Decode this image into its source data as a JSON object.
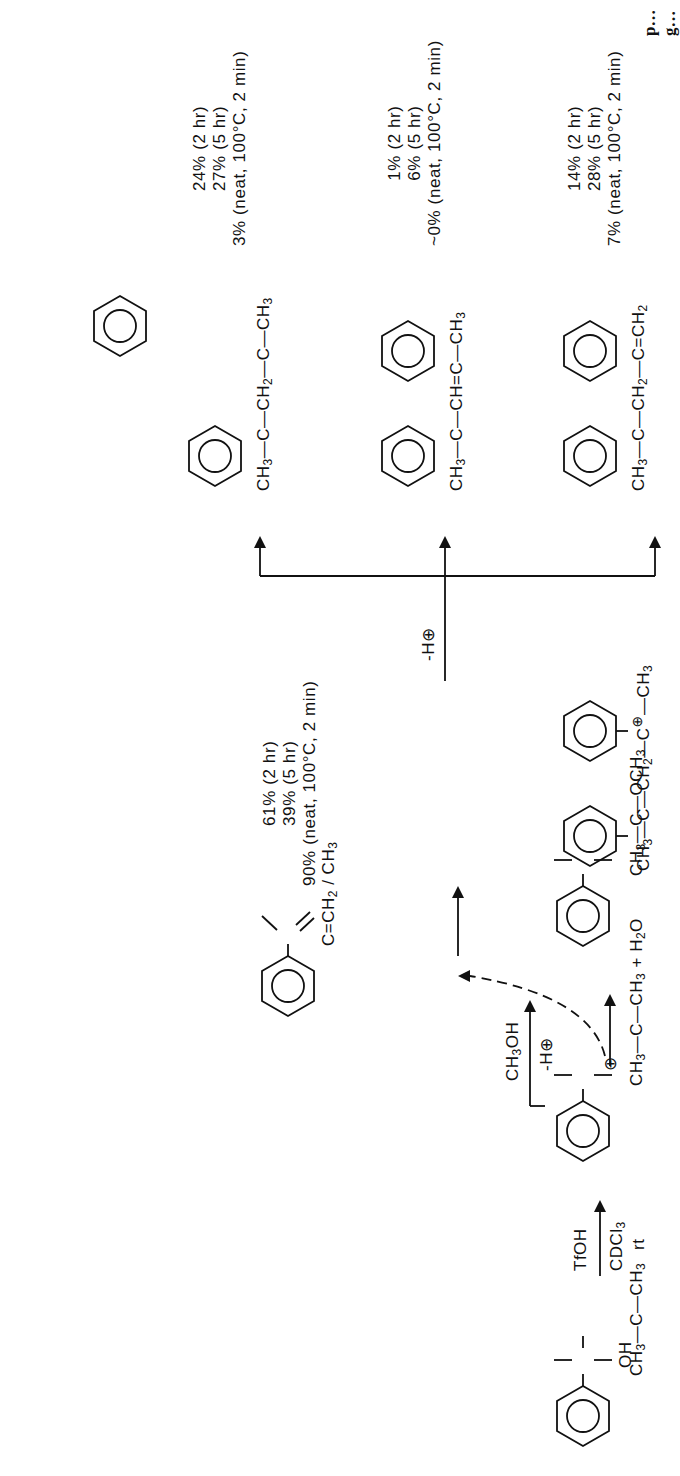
{
  "header": {
    "text": "p…g…"
  },
  "scheme": {
    "starting_material": {
      "name": "2-phenyl-2-propanol",
      "labels": [
        "CH3",
        "C",
        "CH3",
        "OH"
      ]
    },
    "reagents": {
      "above": "TfOH",
      "below": "CDCl3",
      "below2": "rt"
    },
    "cation": {
      "name": "cumyl cation",
      "byproduct": "+ H2O",
      "charge": "⊕"
    },
    "methanol_trap": {
      "reagent": "CH3OH",
      "loss": "-H⊕",
      "product": "cumyl methyl ether",
      "labels": [
        "CH3",
        "C",
        "CH3",
        "OCH3"
      ]
    },
    "alpha_methylstyrene": {
      "labels": [
        "C",
        "CH3",
        "CH2"
      ],
      "yields": [
        "61% (2 hr)",
        "39% (5 hr)",
        "90% (neat, 100°C, 2 min)"
      ]
    },
    "dimer_cation": {
      "labels": [
        "CH3",
        "C",
        "CH3",
        "CH2",
        "C⊕",
        "CH3"
      ]
    },
    "deprotonation": {
      "label": "-H⊕"
    },
    "products": [
      {
        "name": "2,4-diphenyl-4-methyl-1-pentene",
        "labels": [
          "CH3",
          "C",
          "CH3",
          "CH2",
          "C",
          "CH2"
        ],
        "yields": [
          "14% (2 hr)",
          "28% (5 hr)",
          "7% (neat, 100°C, 2 min)"
        ]
      },
      {
        "name": "2,4-diphenyl-4-methyl-2-pentene",
        "labels": [
          "CH3",
          "C",
          "CH3",
          "CH=C",
          "CH3"
        ],
        "yields": [
          "1% (2 hr)",
          "6% (5 hr)",
          "~0% (neat, 100°C, 2 min)"
        ]
      },
      {
        "name": "1,1,3-trimethyl-3-phenylindan",
        "labels": [
          "CH3",
          "C",
          "CH2",
          "C",
          "CH3"
        ],
        "yields": [
          "24% (2 hr)",
          "27% (5 hr)",
          "3% (neat, 100°C, 2 min)"
        ]
      }
    ]
  }
}
